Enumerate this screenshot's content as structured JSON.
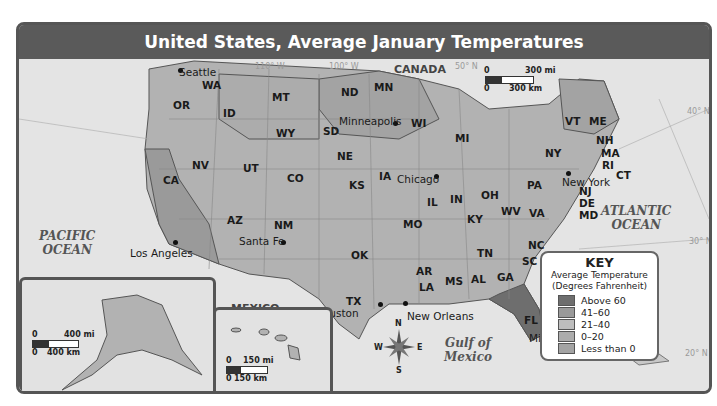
{
  "title": "United States, Average January Temperatures",
  "countries": {
    "canada": "CANADA",
    "mexico": "MEXICO"
  },
  "oceans": {
    "pacific": "PACIFIC\nOCEAN",
    "atlantic": "ATLANTIC\nOCEAN",
    "gulf": "Gulf of\nMexico"
  },
  "states": [
    {
      "code": "WA",
      "x": 183,
      "y": 20
    },
    {
      "code": "OR",
      "x": 154,
      "y": 40
    },
    {
      "code": "ID",
      "x": 204,
      "y": 48
    },
    {
      "code": "MT",
      "x": 253,
      "y": 32
    },
    {
      "code": "WY",
      "x": 257,
      "y": 68
    },
    {
      "code": "ND",
      "x": 322,
      "y": 27
    },
    {
      "code": "SD",
      "x": 304,
      "y": 66
    },
    {
      "code": "MN",
      "x": 355,
      "y": 22
    },
    {
      "code": "NE",
      "x": 318,
      "y": 91
    },
    {
      "code": "IA",
      "x": 360,
      "y": 111
    },
    {
      "code": "WI",
      "x": 392,
      "y": 58
    },
    {
      "code": "MI",
      "x": 436,
      "y": 73
    },
    {
      "code": "IL",
      "x": 408,
      "y": 137
    },
    {
      "code": "IN",
      "x": 431,
      "y": 134
    },
    {
      "code": "OH",
      "x": 462,
      "y": 130
    },
    {
      "code": "NV",
      "x": 173,
      "y": 100
    },
    {
      "code": "UT",
      "x": 224,
      "y": 103
    },
    {
      "code": "CO",
      "x": 268,
      "y": 113
    },
    {
      "code": "CA",
      "x": 144,
      "y": 115
    },
    {
      "code": "KS",
      "x": 330,
      "y": 120
    },
    {
      "code": "MO",
      "x": 384,
      "y": 159
    },
    {
      "code": "KY",
      "x": 448,
      "y": 154
    },
    {
      "code": "WV",
      "x": 482,
      "y": 146
    },
    {
      "code": "VA",
      "x": 510,
      "y": 148
    },
    {
      "code": "PA",
      "x": 508,
      "y": 120
    },
    {
      "code": "NY",
      "x": 526,
      "y": 88
    },
    {
      "code": "VT",
      "x": 546,
      "y": 56
    },
    {
      "code": "ME",
      "x": 570,
      "y": 56
    },
    {
      "code": "NH",
      "x": 577,
      "y": 75
    },
    {
      "code": "MA",
      "x": 582,
      "y": 88
    },
    {
      "code": "RI",
      "x": 583,
      "y": 100
    },
    {
      "code": "CT",
      "x": 597,
      "y": 110
    },
    {
      "code": "NJ",
      "x": 560,
      "y": 126
    },
    {
      "code": "DE",
      "x": 560,
      "y": 138
    },
    {
      "code": "MD",
      "x": 560,
      "y": 150
    },
    {
      "code": "AZ",
      "x": 208,
      "y": 155
    },
    {
      "code": "NM",
      "x": 255,
      "y": 160
    },
    {
      "code": "OK",
      "x": 332,
      "y": 190
    },
    {
      "code": "TX",
      "x": 327,
      "y": 236
    },
    {
      "code": "AR",
      "x": 397,
      "y": 206
    },
    {
      "code": "LA",
      "x": 400,
      "y": 222
    },
    {
      "code": "MS",
      "x": 426,
      "y": 216
    },
    {
      "code": "AL",
      "x": 452,
      "y": 214
    },
    {
      "code": "GA",
      "x": 478,
      "y": 212
    },
    {
      "code": "TN",
      "x": 458,
      "y": 188
    },
    {
      "code": "NC",
      "x": 509,
      "y": 180
    },
    {
      "code": "SC",
      "x": 503,
      "y": 196
    },
    {
      "code": "FL",
      "x": 505,
      "y": 255
    },
    {
      "code": "AK",
      "x": 106,
      "y": 284
    },
    {
      "code": "HI",
      "x": 282,
      "y": 299
    }
  ],
  "cities": [
    {
      "name": "Seattle",
      "lx": 160,
      "ly": 7,
      "dx": 161,
      "dy": 11
    },
    {
      "name": "Minneapolis",
      "lx": 320,
      "ly": 56,
      "dx": 376,
      "dy": 64
    },
    {
      "name": "Chicago",
      "lx": 378,
      "ly": 114,
      "dx": 417,
      "dy": 117
    },
    {
      "name": "New York",
      "lx": 543,
      "ly": 117,
      "dx": 549,
      "dy": 114
    },
    {
      "name": "Los Angeles",
      "lx": 111,
      "ly": 188,
      "dx": 156,
      "dy": 183
    },
    {
      "name": "Santa Fe",
      "lx": 220,
      "ly": 176,
      "dx": 264,
      "dy": 183
    },
    {
      "name": "Houston",
      "lx": 296,
      "ly": 248,
      "dx": 361,
      "dy": 245
    },
    {
      "name": "New Orleans",
      "lx": 388,
      "ly": 251,
      "dx": 386,
      "dy": 244
    },
    {
      "name": "Miami",
      "lx": 510,
      "ly": 273,
      "dx": 526,
      "dy": 276
    },
    {
      "name": "Fairbanks",
      "lx": 97,
      "ly": 301,
      "dx": 124,
      "dy": 295
    },
    {
      "name": "Honolulu",
      "lx": 202,
      "ly": 313,
      "dx": 246,
      "dy": 311
    }
  ],
  "coords": [
    {
      "t": "110° W",
      "x": 236,
      "y": 3
    },
    {
      "t": "100° W",
      "x": 310,
      "y": 3
    },
    {
      "t": "50° N",
      "x": 436,
      "y": 3
    },
    {
      "t": "40° N",
      "x": 668,
      "y": 48
    },
    {
      "t": "30° N",
      "x": 670,
      "y": 178
    },
    {
      "t": "20° N",
      "x": 666,
      "y": 290
    },
    {
      "t": "70° W",
      "x": 640,
      "y": 336
    },
    {
      "t": "80° W",
      "x": 558,
      "y": 336
    },
    {
      "t": "90° W",
      "x": 418,
      "y": 336
    },
    {
      "t": "130° W",
      "x": 18,
      "y": 226
    },
    {
      "t": "120° W",
      "x": 124,
      "y": 224
    },
    {
      "t": "180°",
      "x": 5,
      "y": 340
    },
    {
      "t": "160° W",
      "x": 70,
      "y": 340
    },
    {
      "t": "140° W",
      "x": 152,
      "y": 340
    },
    {
      "t": "160° W",
      "x": 195,
      "y": 258
    },
    {
      "t": "155° W",
      "x": 262,
      "y": 258
    },
    {
      "t": "20° N",
      "x": 291,
      "y": 326
    }
  ],
  "scales": {
    "main": {
      "mi": "300 mi",
      "km": "300 km",
      "zero": "0"
    },
    "alaska": {
      "mi": "400 mi",
      "km": "400 km",
      "zero": "0"
    },
    "hawaii": {
      "mi": "150 mi",
      "km": "150 km",
      "zero": "0"
    }
  },
  "compass": {
    "n": "N",
    "s": "S",
    "e": "E",
    "w": "W"
  },
  "key": {
    "title": "KEY",
    "subtitle1": "Average Temperature",
    "subtitle2": "(Degrees Fahrenheit)",
    "items": [
      {
        "label": "Above 60",
        "color": "#6e6e6e"
      },
      {
        "label": "41–60",
        "color": "#9a9a9a"
      },
      {
        "label": "21–40",
        "color": "#bdbdbd"
      },
      {
        "label": "0–20",
        "color": "#acacac"
      },
      {
        "label": "Less than 0",
        "color": "#a3a3a3"
      }
    ]
  }
}
